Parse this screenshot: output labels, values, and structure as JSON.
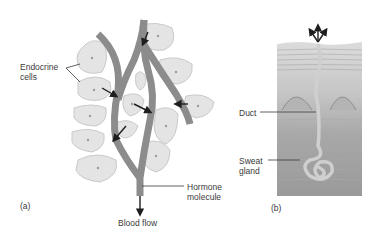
{
  "panel_a": {
    "label": "(a)",
    "endocrine_cells_line1": "Endocrine",
    "endocrine_cells_line2": "cells",
    "hormone_line1": "Hormone",
    "hormone_line2": "molecule",
    "blood_flow": "Blood flow"
  },
  "panel_b": {
    "label": "(b)",
    "duct": "Duct",
    "sweat_line1": "Sweat",
    "sweat_line2": "gland"
  },
  "colors": {
    "cell_fill": "#e4e4e4",
    "cell_stroke": "#c8c8c8",
    "vessel": "#8a8a8a",
    "skin_top": "#d4d4d4",
    "skin_mid": "#b8b8b8",
    "skin_bottom": "#9a9a9a",
    "arrow": "#1e1e1e",
    "gland": "#cfcfcf"
  }
}
